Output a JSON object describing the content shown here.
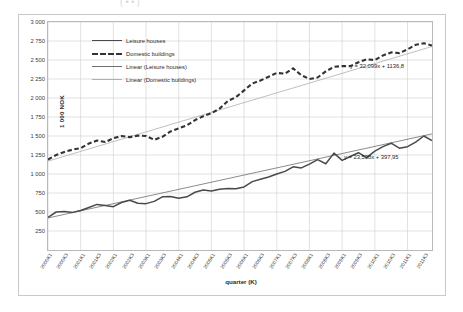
{
  "top_strip": {
    "faint_text": "( • • )"
  },
  "chart_data": {
    "type": "line",
    "title": "",
    "xlabel": "quarter (K)",
    "ylabel": "1 000 NOK",
    "ylim": [
      0,
      3000
    ],
    "yticks": [
      250,
      500,
      750,
      1000,
      1250,
      1500,
      1750,
      2000,
      2250,
      2500,
      2750,
      3000
    ],
    "ytick_labels": [
      "250",
      "500",
      "750",
      "1 000",
      "1 250",
      "1 500",
      "1 750",
      "2 000",
      "2 250",
      "2 500",
      "2 750",
      "3 000"
    ],
    "grid": true,
    "legend_position": "top-left",
    "legend": [
      "Leisure houses",
      "Domestic buildings",
      "Linear (Leisure houses)",
      "Linear (Domestic buildings)"
    ],
    "x": [
      "2000K1",
      "2000K2",
      "2000K3",
      "2000K4",
      "2001K1",
      "2001K2",
      "2001K3",
      "2001K4",
      "2002K1",
      "2002K2",
      "2002K3",
      "2002K4",
      "2003K1",
      "2003K2",
      "2003K3",
      "2003K4",
      "2004K1",
      "2004K2",
      "2004K3",
      "2004K4",
      "2005K1",
      "2005K2",
      "2005K3",
      "2005K4",
      "2006K1",
      "2006K2",
      "2006K3",
      "2006K4",
      "2007K1",
      "2007K2",
      "2007K3",
      "2007K4",
      "2008K1",
      "2008K2",
      "2008K3",
      "2008K4",
      "2009K1",
      "2009K2",
      "2009K3",
      "2009K4",
      "2010K1",
      "2010K2",
      "2010K3",
      "2010K4",
      "2011K1",
      "2011K2",
      "2011K3",
      "2011K4"
    ],
    "xtick_labels": [
      "2000K1",
      "2000K3",
      "2001K1",
      "2001K3",
      "2002K1",
      "2002K3",
      "2003K1",
      "2003K3",
      "2004K1",
      "2004K3",
      "2005K1",
      "2005K3",
      "2006K1",
      "2006K3",
      "2007K1",
      "2007K3",
      "2008K1",
      "2008K3",
      "2009K1",
      "2009K3",
      "2010K1",
      "2010K3",
      "2011K1",
      "2011K3"
    ],
    "series": [
      {
        "name": "Leisure houses",
        "style": "solid",
        "color": "#4a4a4a",
        "values": [
          430,
          500,
          505,
          495,
          520,
          560,
          600,
          585,
          570,
          625,
          655,
          615,
          610,
          640,
          700,
          705,
          680,
          700,
          760,
          790,
          775,
          800,
          810,
          805,
          830,
          900,
          930,
          960,
          1000,
          1035,
          1095,
          1080,
          1130,
          1190,
          1135,
          1275,
          1180,
          1230,
          1280,
          1215,
          1300,
          1360,
          1405,
          1340,
          1360,
          1420,
          1500,
          1440
        ]
      },
      {
        "name": "Domestic buildings",
        "style": "dashed",
        "color": "#333333",
        "values": [
          1190,
          1250,
          1290,
          1320,
          1340,
          1400,
          1440,
          1420,
          1470,
          1500,
          1485,
          1505,
          1500,
          1450,
          1490,
          1560,
          1600,
          1640,
          1710,
          1760,
          1800,
          1860,
          1960,
          2010,
          2100,
          2190,
          2230,
          2280,
          2330,
          2320,
          2390,
          2300,
          2250,
          2270,
          2350,
          2410,
          2420,
          2420,
          2470,
          2510,
          2500,
          2560,
          2600,
          2590,
          2640,
          2700,
          2720,
          2690
        ]
      }
    ],
    "trendlines": [
      {
        "name": "Linear (Leisure houses)",
        "equation": "y = 23,538x + 397,95",
        "slope": 23.538,
        "intercept": 397.95,
        "color": "#6f6f6f"
      },
      {
        "name": "Linear (Domestic buildings)",
        "equation": "y = 32,099x + 1136,8",
        "slope": 32.099,
        "intercept": 1136.8,
        "color": "#b0b0b0"
      }
    ],
    "annotations": [
      {
        "text": "y = 32,099x + 1136,8",
        "target": "Linear (Domestic buildings)"
      },
      {
        "text": "y = 23,538x + 397,95",
        "target": "Linear (Leisure houses)"
      }
    ]
  }
}
